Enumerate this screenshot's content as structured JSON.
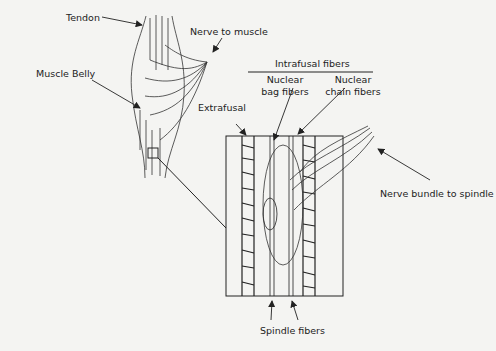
{
  "diagram": {
    "labels": {
      "tendon": "Tendon",
      "nerve_to_muscle": "Nerve to muscle",
      "muscle_belly": "Muscle Belly",
      "intrafusal_fibers": "Intrafusal fibers",
      "nuclear_bag_1": "Nuclear",
      "nuclear_bag_2": "bag fibers",
      "nuclear_chain_1": "Nuclear",
      "nuclear_chain_2": "chain fibers",
      "extrafusal": "Extrafusal",
      "nerve_bundle": "Nerve bundle to spindle",
      "spindle_fibers": "Spindle fibers"
    },
    "colors": {
      "ink": "#222222",
      "background": "#f4f4f2"
    }
  }
}
